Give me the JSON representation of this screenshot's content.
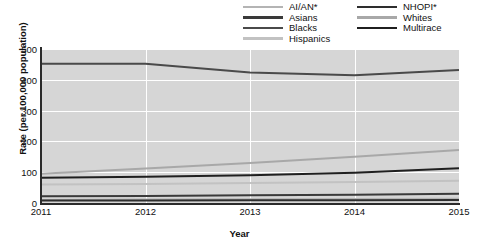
{
  "chart_data": {
    "type": "line",
    "title": "",
    "xlabel": "Year",
    "ylabel": "Rate (per 100,000 population)",
    "x": [
      2011,
      2012,
      2013,
      2014,
      2015
    ],
    "xtick_labels": [
      "2011",
      "2012",
      "2013",
      "2014",
      "2015"
    ],
    "ytick_labels": [
      "0",
      "100",
      "200",
      "300",
      "400",
      "500"
    ],
    "yticks": [
      0,
      100,
      200,
      300,
      400,
      500
    ],
    "ylim": [
      0,
      500
    ],
    "xlim": [
      2011,
      2015
    ],
    "grid": true,
    "legend_position": "top-right",
    "plot_background": "#d6d6d6",
    "gridline_color": "#ffffff",
    "series": [
      {
        "name": "AI/AN*",
        "color": "#b4b4b4",
        "values": [
          10,
          11,
          12,
          13,
          14
        ]
      },
      {
        "name": "Asians",
        "color": "#3a3a3a",
        "values": [
          22,
          23,
          25,
          27,
          30
        ]
      },
      {
        "name": "Blacks",
        "color": "#4a4a4a",
        "values": [
          452,
          452,
          424,
          415,
          432
        ]
      },
      {
        "name": "Hispanics",
        "color": "#c2c2c2",
        "values": [
          60,
          62,
          65,
          68,
          72
        ]
      },
      {
        "name": "NHOPI*",
        "color": "#2e2e2e",
        "values": [
          8,
          8,
          9,
          9,
          10
        ]
      },
      {
        "name": "Whites",
        "color": "#a8a8a8",
        "values": [
          95,
          112,
          130,
          150,
          172
        ]
      },
      {
        "name": "Multirace",
        "color": "#1f1f1f",
        "values": [
          82,
          85,
          90,
          98,
          113
        ]
      }
    ]
  },
  "legend": {
    "column1": [
      "AI/AN*",
      "Asians",
      "Blacks",
      "Hispanics"
    ],
    "column2": [
      "NHOPI*",
      "Whites",
      "Multirace"
    ]
  }
}
